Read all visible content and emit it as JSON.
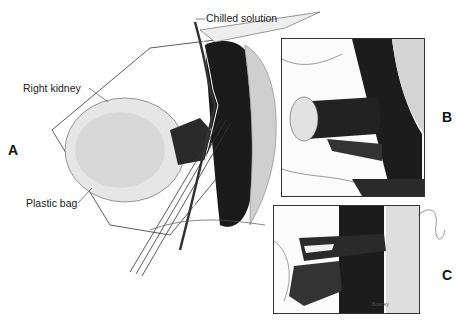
{
  "figure": {
    "panels": [
      {
        "id": "A",
        "letter": "A",
        "description": "Main surgical view of right kidney in plastic bag with cannula and major vessels"
      },
      {
        "id": "B",
        "letter": "B",
        "description": "Inset showing vascular anastomosis to large vessel"
      },
      {
        "id": "C",
        "letter": "C",
        "description": "Inset showing completed vessel anastomoses"
      }
    ],
    "labels": {
      "chilled_solution": "Chilled solution",
      "right_kidney": "Right kidney",
      "plastic_bag": "Plastic bag"
    },
    "signature": "Bowrey",
    "colors": {
      "ink": "#111111",
      "shade": "#2a2a2a",
      "stipple": "#888888",
      "paper": "#ffffff"
    }
  }
}
